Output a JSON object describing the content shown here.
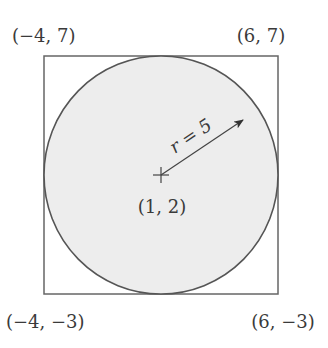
{
  "diagram": {
    "type": "circle-inscribed-in-square",
    "square": {
      "corners": {
        "top_left": "(−4, 7)",
        "top_right": "(6, 7)",
        "bottom_left": "(−4, −3)",
        "bottom_right": "(6, −3)"
      }
    },
    "circle": {
      "center_label": "(1, 2)",
      "radius_label": "r = 5",
      "fill_color": "#ededed",
      "stroke_color": "#555555"
    },
    "colors": {
      "line": "#555555",
      "text": "#3a3a3a",
      "background": "#ffffff"
    }
  }
}
